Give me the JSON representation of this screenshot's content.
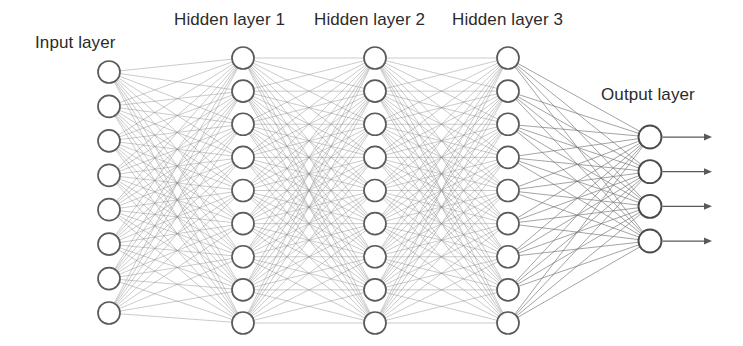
{
  "diagram": {
    "type": "neural-network",
    "background_color": "#ffffff",
    "node_fill_color": "#ffffff",
    "node_stroke_color": "#5a5a5a",
    "edge_color": "#8a8a8a",
    "label_color": "#2b2b2b",
    "canvas": {
      "width": 743,
      "height": 346
    }
  },
  "labels": {
    "input": "Input layer",
    "hidden1": "Hidden layer 1",
    "hidden2": "Hidden layer 2",
    "hidden3": "Hidden layer 3",
    "output": "Output layer"
  },
  "layers": [
    {
      "id": "input",
      "label": "Input layer",
      "node_count": 8,
      "x": 109,
      "y_start": 72,
      "y_end": 313,
      "node_radius": 11,
      "label_x": 35,
      "label_y": 33
    },
    {
      "id": "hidden1",
      "label": "Hidden layer 1",
      "node_count": 9,
      "x": 243,
      "y_start": 58,
      "y_end": 323,
      "node_radius": 11,
      "label_x": 174,
      "label_y": 10
    },
    {
      "id": "hidden2",
      "label": "Hidden layer 2",
      "node_count": 9,
      "x": 375,
      "y_start": 58,
      "y_end": 323,
      "node_radius": 11,
      "label_x": 314,
      "label_y": 10
    },
    {
      "id": "hidden3",
      "label": "Hidden layer 3",
      "node_count": 9,
      "x": 508,
      "y_start": 58,
      "y_end": 323,
      "node_radius": 11,
      "label_x": 452,
      "label_y": 10
    },
    {
      "id": "output",
      "label": "Output layer",
      "node_count": 4,
      "x": 650,
      "y_start": 137,
      "y_end": 241,
      "node_radius": 11.5,
      "label_x": 601,
      "label_y": 85
    }
  ],
  "connections": [
    {
      "from": "input",
      "to": "hidden1",
      "fully_connected": true,
      "edge_count": 72
    },
    {
      "from": "hidden1",
      "to": "hidden2",
      "fully_connected": true,
      "edge_count": 81
    },
    {
      "from": "hidden2",
      "to": "hidden3",
      "fully_connected": true,
      "edge_count": 81
    },
    {
      "from": "hidden3",
      "to": "output",
      "fully_connected": true,
      "edge_count": 36
    }
  ],
  "output_arrows": {
    "count": 4,
    "start_offset": 12,
    "end_x": 712,
    "color": "#5a5a5a"
  }
}
